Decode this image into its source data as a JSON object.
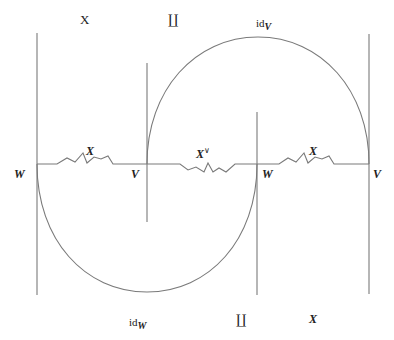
{
  "diagram": {
    "type": "string-diagram",
    "colors": {
      "line": "#7a7a7a",
      "text": "#222222",
      "background": "#ffffff"
    },
    "top_labels": {
      "left": "X",
      "middle": "∐",
      "right_base": "id",
      "right_sub": "V"
    },
    "bottom_labels": {
      "left_base": "id",
      "left_sub": "W",
      "middle": "∐",
      "right": "X"
    },
    "strand_labels": [
      {
        "text": "X",
        "position": "wiggle-1"
      },
      {
        "text": "X",
        "sup": "∨",
        "position": "wiggle-2"
      },
      {
        "text": "X",
        "position": "wiggle-3"
      }
    ],
    "node_labels": [
      {
        "text": "W",
        "at": "line-1"
      },
      {
        "text": "V",
        "at": "line-2"
      },
      {
        "text": "W",
        "at": "line-3"
      },
      {
        "text": "V",
        "at": "line-4"
      }
    ]
  }
}
